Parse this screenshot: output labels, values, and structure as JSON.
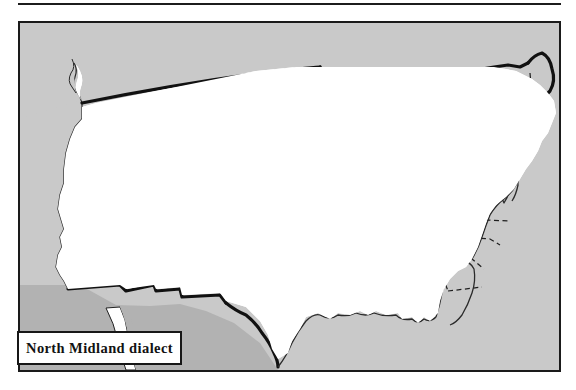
{
  "figure": {
    "kind": "dialect-region-map",
    "region_title": "North Midland dialect",
    "country": "United States"
  },
  "legend": {
    "label": "North Midland dialect",
    "swatch_color": "#999999"
  },
  "colors": {
    "ocean": "#c9c9c9",
    "land_outside": "#b5b5b5",
    "state_fill": "#ffffff",
    "dialect_fill": "#999999",
    "state_border": "#1a1a1a",
    "national_border": "#111111",
    "frame": "#1a1a1a",
    "rule": "#1c1c1c"
  },
  "map": {
    "frame_visible": true,
    "top_rule_visible": true,
    "state_borders_style": "dashed",
    "national_border_style": "thick-solid",
    "great_lakes_visible": true,
    "shaded_region_name": "North Midland dialect",
    "shaded_region_extent": "Nebraska and Kansas east through Iowa, Missouri, Illinois, Indiana, Ohio, northern West Virginia and Pennsylvania to the mid-Atlantic coast, with a southwest lobe into the Oklahoma panhandle"
  }
}
